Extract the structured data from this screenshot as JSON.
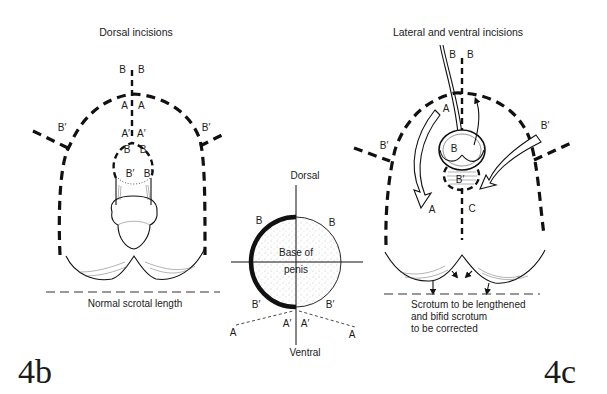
{
  "figure_4b": {
    "panel_label": "4b",
    "title": "Dorsal incisions",
    "labels": {
      "top_left_b": "B",
      "top_right_b": "B",
      "a_left": "A",
      "a_right": "A",
      "a_prime_left": "A′",
      "a_prime_right": "A′",
      "b_left_inner": "B",
      "b_right_inner": "B",
      "b_prime_inner_left": "B′",
      "b_prime_inner_right": "B′",
      "b_prime_outer_left": "B′",
      "b_prime_outer_right": "B′"
    },
    "caption": "Normal scrotal length"
  },
  "cross_section": {
    "top_label": "Dorsal",
    "bottom_label": "Ventral",
    "center_label_line1": "Base of",
    "center_label_line2": "penis",
    "labels": {
      "b_upper_left": "B",
      "b_upper_right": "B",
      "b_prime_lower_left": "B′",
      "b_prime_lower_right": "B′",
      "a_prime_left": "A′",
      "a_prime_right": "A′",
      "a_left": "A",
      "a_right": "A"
    }
  },
  "figure_4c": {
    "panel_label": "4c",
    "title": "Lateral and ventral incisions",
    "labels": {
      "top_left_b": "B",
      "top_right_b": "B",
      "a_upper": "A",
      "b_prime_right": "B′",
      "b_prime_left": "B′",
      "b_inner": "B",
      "b_prime_inner": "B′",
      "a_lower": "A",
      "c_label": "C"
    },
    "caption_lines": [
      "Scrotum to be lengthened",
      "and bifid scrotum",
      "to be corrected"
    ]
  }
}
